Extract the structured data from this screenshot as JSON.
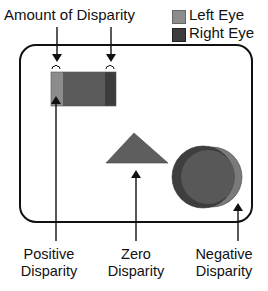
{
  "title_label": "Amount of Disparity",
  "legend": {
    "items": [
      {
        "label": "Left Eye",
        "color": "#8c8c8c"
      },
      {
        "label": "Right Eye",
        "color": "#3c3c3c"
      }
    ]
  },
  "bottom_labels": {
    "positive": {
      "line1": "Positive",
      "line2": "Disparity"
    },
    "zero": {
      "line1": "Zero",
      "line2": "Disparity"
    },
    "negative": {
      "line1": "Negative",
      "line2": "Disparity"
    }
  },
  "colors": {
    "left_eye": "#8c8c8c",
    "right_eye": "#3c3c3c",
    "overlap": "#5a5a5a",
    "outline": "#111111",
    "background": "#ffffff"
  }
}
